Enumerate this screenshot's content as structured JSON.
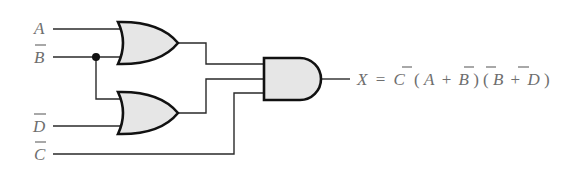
{
  "diagram": {
    "type": "logic-circuit",
    "inputs": [
      {
        "id": "A",
        "label": "A",
        "complemented": false
      },
      {
        "id": "Bbar",
        "label": "B",
        "complemented": true
      },
      {
        "id": "Dbar",
        "label": "D",
        "complemented": true
      },
      {
        "id": "Cbar",
        "label": "C",
        "complemented": true
      }
    ],
    "gates": [
      {
        "id": "or1",
        "type": "OR",
        "inputs": [
          "A",
          "Bbar"
        ]
      },
      {
        "id": "or2",
        "type": "OR",
        "inputs": [
          "Bbar",
          "Dbar"
        ]
      },
      {
        "id": "and1",
        "type": "AND",
        "inputs": [
          "or1",
          "or2",
          "Cbar"
        ]
      }
    ],
    "output": {
      "label": "X",
      "equals": "=",
      "expression_parts": {
        "c": "C",
        "open1": "(",
        "a": "A",
        "plus1": "+",
        "b1": "B",
        "close1": ")",
        "open2": "(",
        "b2": "B",
        "plus2": "+",
        "d": "D",
        "close2": ")"
      },
      "expression_text": "X = C̄ (A + B̄)(B̄ + D̄)"
    },
    "colors": {
      "gate_fill": "#e6e6e6",
      "gate_stroke": "#111111",
      "wire": "#2a2a2a",
      "text": "#6e6e6e"
    }
  }
}
